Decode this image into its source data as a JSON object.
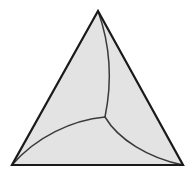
{
  "figure": {
    "canvas": {
      "width": 196,
      "height": 177,
      "background_color": "#ffffff"
    },
    "style": {
      "fill_color": "#e3e3e3",
      "outline_color": "#1a1a1a",
      "outline_width": 2.2,
      "arc_color": "#3a3a3a",
      "arc_width": 1.5
    },
    "triangle": {
      "name": "outer-triangle",
      "vertices": [
        {
          "label": "apex",
          "x": 98,
          "y": 11
        },
        {
          "label": "bottom-left",
          "x": 12,
          "y": 165
        },
        {
          "label": "bottom-right",
          "x": 183,
          "y": 165
        }
      ],
      "path": "M 98 11 L 183 165 L 12 165 Z"
    },
    "triple_point": {
      "name": "central-triple-point",
      "x": 105,
      "y": 117
    },
    "arcs": [
      {
        "name": "arc-apex-to-center",
        "from": "apex",
        "to": "triple-point",
        "bulge_direction": "right",
        "path": "M 98 11 C 112 50 111 88 105 117"
      },
      {
        "name": "arc-center-to-bottom-left",
        "from": "triple-point",
        "to": "bottom-left",
        "bulge_direction": "up",
        "path": "M 105 117 C 72 120 36 137 12 165"
      },
      {
        "name": "arc-center-to-bottom-right",
        "from": "triple-point",
        "to": "bottom-right",
        "bulge_direction": "down-left",
        "path": "M 105 117 C 118 139 148 158 183 165"
      }
    ],
    "regions": [
      {
        "name": "region-left",
        "label": "left lobe",
        "fill_color": "#e3e3e3"
      },
      {
        "name": "region-right",
        "label": "right lobe",
        "fill_color": "#e3e3e3"
      },
      {
        "name": "region-bottom",
        "label": "bottom lobe",
        "fill_color": "#e3e3e3"
      }
    ]
  }
}
